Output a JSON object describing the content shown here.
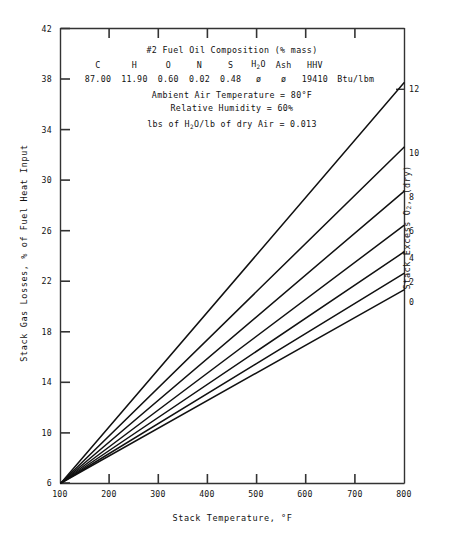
{
  "chart_data": {
    "type": "line",
    "title": "",
    "xlabel": "Stack Temperature, °F",
    "ylabel": "Stack Gas Losses, % of Fuel Heat Input",
    "y2label": "Stack Excess O2, (dry)",
    "xlim": [
      100,
      800
    ],
    "ylim": [
      6,
      42
    ],
    "xticks": [
      100,
      200,
      300,
      400,
      500,
      600,
      700,
      800
    ],
    "yticks": [
      6,
      10,
      14,
      18,
      22,
      26,
      30,
      34,
      38,
      42
    ],
    "y2_tick_labels": [
      "0",
      "2",
      "4",
      "6",
      "8",
      "10",
      "12"
    ],
    "grid": false,
    "legend_position": "right-axis-labels",
    "x": [
      100,
      800
    ],
    "series": [
      {
        "name": "0",
        "excess_o2": 0,
        "values": [
          6.0,
          21.3
        ]
      },
      {
        "name": "2",
        "excess_o2": 2,
        "values": [
          6.0,
          22.6
        ]
      },
      {
        "name": "4",
        "excess_o2": 4,
        "values": [
          6.0,
          24.3
        ]
      },
      {
        "name": "6",
        "excess_o2": 6,
        "values": [
          6.0,
          26.4
        ]
      },
      {
        "name": "8",
        "excess_o2": 8,
        "values": [
          6.0,
          29.1
        ]
      },
      {
        "name": "10",
        "excess_o2": 10,
        "values": [
          6.0,
          32.6
        ]
      },
      {
        "name": "12",
        "excess_o2": 12,
        "values": [
          6.0,
          37.7
        ]
      }
    ]
  },
  "annotation": {
    "composition_title": "#2 Fuel Oil Composition (% mass)",
    "headers": [
      "C",
      "H",
      "O",
      "N",
      "S",
      "H2O",
      "Ash",
      "HHV"
    ],
    "header_h2o_pre": "H",
    "header_h2o_sub": "2",
    "header_h2o_post": "O",
    "values": [
      "87.00",
      "11.90",
      "0.60",
      "0.02",
      "0.48",
      "ø",
      "ø",
      "19410"
    ],
    "hhv_units": "Btu/lbm",
    "ambient_air_temperature": "Ambient Air Temperature = 80°F",
    "relative_humidity": "Relative Humidity = 60%",
    "humidity_ratio_pre": "lbs of H",
    "humidity_ratio_sub": "2",
    "humidity_ratio_post": "O/lb of dry Air = 0.013"
  },
  "axes": {
    "y_tick_labels": [
      "42",
      "38",
      "34",
      "30",
      "26",
      "22",
      "18",
      "14",
      "10",
      "6"
    ],
    "x_tick_labels": [
      "100",
      "200",
      "300",
      "400",
      "500",
      "600",
      "700",
      "800"
    ],
    "y2_tick_labels": [
      "12",
      "10",
      "8",
      "6",
      "4",
      "2",
      "0"
    ],
    "y_title": "Stack Gas Losses, % of Fuel Heat Input",
    "x_title": "Stack Temperature, °F",
    "y2_title_pre": "Stack Excess O",
    "y2_title_sub": "2",
    "y2_title_post": ", (dry)"
  },
  "colors": {
    "line": "#111111",
    "axis": "#333333",
    "background": "#ffffff"
  }
}
